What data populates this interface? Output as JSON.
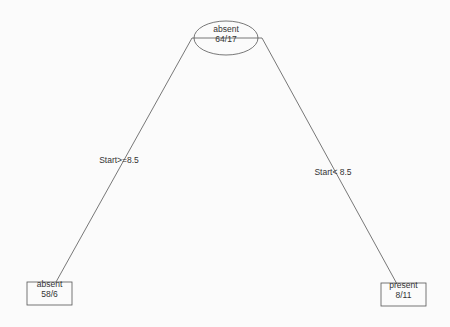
{
  "diagram": {
    "type": "decision-tree",
    "colors": {
      "line": "#555555",
      "text": "#333333",
      "background": "#fbfbfb"
    },
    "root": {
      "class": "absent",
      "counts": "64/17"
    },
    "splits": {
      "left": {
        "label": "Start>=8.5"
      },
      "right": {
        "label": "Start< 8.5"
      }
    },
    "leaves": {
      "left": {
        "class": "absent",
        "counts": "58/6"
      },
      "right": {
        "class": "present",
        "counts": "8/11"
      }
    }
  }
}
